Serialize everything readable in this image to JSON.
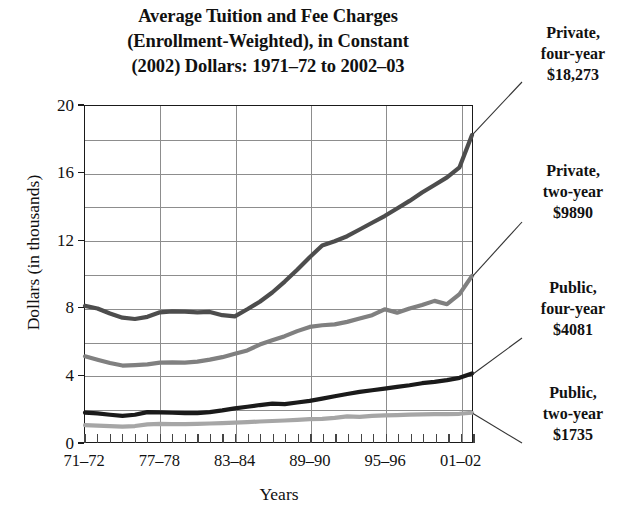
{
  "title": {
    "line1": "Average Tuition and Fee Charges",
    "line2": "(Enrollment-Weighted), in Constant",
    "line3": "(2002) Dollars: 1971–72 to 2002–03"
  },
  "axes": {
    "ylabel": "Dollars (in thousands)",
    "xlabel": "Years",
    "yticks": [
      "0",
      "4",
      "8",
      "12",
      "16",
      "20"
    ],
    "xticks": [
      "71–72",
      "77–78",
      "83–84",
      "89–90",
      "95–96",
      "01–02"
    ]
  },
  "annotations": [
    {
      "l1": "Private,",
      "l2": "four-year",
      "l3": "$18,273"
    },
    {
      "l1": "Private,",
      "l2": "two-year",
      "l3": "$9890"
    },
    {
      "l1": "Public,",
      "l2": "four-year",
      "l3": "$4081"
    },
    {
      "l1": "Public,",
      "l2": "two-year",
      "l3": "$1735"
    }
  ],
  "colors": {
    "private_four_year": "#4d4d4d",
    "private_two_year": "#808080",
    "public_four_year": "#1a1a1a",
    "public_two_year": "#a6a6a6",
    "grid": "#8d8d8d",
    "frame": "#1a1a1a",
    "text": "#111111"
  },
  "chart_data": {
    "type": "line",
    "title": "Average Tuition and Fee Charges (Enrollment-Weighted), in Constant (2002) Dollars: 1971–72 to 2002–03",
    "xlabel": "Years",
    "ylabel": "Dollars (in thousands)",
    "xlim": [
      0,
      31
    ],
    "ylim": [
      0,
      20
    ],
    "ytick_values": [
      0,
      4,
      8,
      12,
      16,
      20
    ],
    "grid": "horizontal and vertical",
    "legend_position": "right, as end-of-line callouts",
    "x": [
      "71–72",
      "72–73",
      "73–74",
      "74–75",
      "75–76",
      "76–77",
      "77–78",
      "78–79",
      "79–80",
      "80–81",
      "81–82",
      "82–83",
      "83–84",
      "84–85",
      "85–86",
      "86–87",
      "87–88",
      "88–89",
      "89–90",
      "90–91",
      "91–92",
      "92–93",
      "93–94",
      "94–95",
      "95–96",
      "96–97",
      "97–98",
      "98–99",
      "99–00",
      "00–01",
      "01–02",
      "02–03"
    ],
    "series": [
      {
        "name": "Private, four-year",
        "end_label": "$18,273",
        "color": "#4d4d4d",
        "values": [
          8.1,
          7.95,
          7.65,
          7.4,
          7.32,
          7.45,
          7.72,
          7.78,
          7.76,
          7.72,
          7.74,
          7.55,
          7.48,
          7.9,
          8.35,
          8.9,
          9.55,
          10.25,
          11.0,
          11.7,
          11.95,
          12.25,
          12.65,
          13.05,
          13.45,
          13.9,
          14.35,
          14.85,
          15.3,
          15.75,
          16.35,
          18.27
        ]
      },
      {
        "name": "Private, two-year",
        "end_label": "$9890",
        "color": "#808080",
        "values": [
          5.1,
          4.9,
          4.7,
          4.55,
          4.58,
          4.62,
          4.72,
          4.74,
          4.72,
          4.78,
          4.9,
          5.05,
          5.25,
          5.45,
          5.8,
          6.05,
          6.3,
          6.6,
          6.85,
          6.95,
          7.0,
          7.15,
          7.35,
          7.55,
          7.9,
          7.7,
          7.95,
          8.15,
          8.4,
          8.2,
          8.8,
          9.89
        ]
      },
      {
        "name": "Public, four-year",
        "end_label": "$4081",
        "color": "#1a1a1a",
        "values": [
          1.75,
          1.7,
          1.62,
          1.55,
          1.62,
          1.78,
          1.76,
          1.74,
          1.72,
          1.72,
          1.78,
          1.88,
          2.0,
          2.1,
          2.2,
          2.28,
          2.25,
          2.35,
          2.45,
          2.58,
          2.72,
          2.86,
          2.98,
          3.08,
          3.18,
          3.28,
          3.38,
          3.5,
          3.58,
          3.68,
          3.82,
          4.08
        ]
      },
      {
        "name": "Public, two-year",
        "end_label": "$1735",
        "color": "#a6a6a6",
        "values": [
          1.0,
          0.98,
          0.95,
          0.92,
          0.95,
          1.05,
          1.08,
          1.06,
          1.06,
          1.08,
          1.1,
          1.12,
          1.15,
          1.18,
          1.22,
          1.25,
          1.28,
          1.32,
          1.36,
          1.38,
          1.44,
          1.52,
          1.5,
          1.55,
          1.58,
          1.6,
          1.63,
          1.65,
          1.66,
          1.66,
          1.68,
          1.74
        ]
      }
    ]
  }
}
